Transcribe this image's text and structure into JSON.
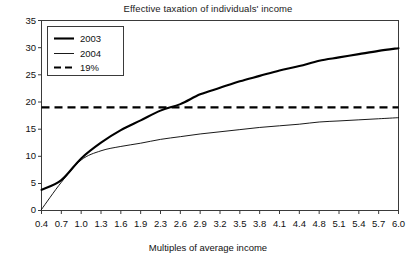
{
  "chart_data": {
    "type": "line",
    "title": "Effective taxation of individuals' income",
    "xlabel": "Multiples of average income",
    "ylabel": "",
    "xlim": [
      0.4,
      6.0
    ],
    "ylim": [
      0,
      35
    ],
    "grid": false,
    "legend_position": "top-left",
    "xtick_labels": [
      "0.4",
      "0.7",
      "1.0",
      "1.3",
      "1.6",
      "1.9",
      "2.3",
      "2.6",
      "2.9",
      "3.2",
      "3.5",
      "3.8",
      "4.1",
      "4.4",
      "4.8",
      "5.1",
      "5.4",
      "5.7",
      "6.0"
    ],
    "ytick_labels": [
      "0",
      "5",
      "10",
      "15",
      "20",
      "25",
      "30",
      "35"
    ],
    "ytick_values": [
      0,
      5,
      10,
      15,
      20,
      25,
      30,
      35
    ],
    "x": [
      0.4,
      0.7,
      1.0,
      1.3,
      1.6,
      1.9,
      2.3,
      2.6,
      2.9,
      3.2,
      3.5,
      3.8,
      4.1,
      4.4,
      4.8,
      5.1,
      5.4,
      5.7,
      6.0
    ],
    "series": [
      {
        "name": "2003",
        "style": "solid-thick",
        "color": "#000000",
        "values": [
          3.8,
          5.6,
          9.6,
          12.5,
          14.8,
          16.6,
          18.4,
          19.6,
          21.4,
          22.6,
          23.8,
          24.8,
          25.8,
          26.6,
          27.6,
          28.2,
          28.8,
          29.4,
          29.9
        ]
      },
      {
        "name": "2004",
        "style": "solid-thin",
        "color": "#000000",
        "values": [
          0.2,
          5.2,
          9.3,
          11.0,
          11.8,
          12.4,
          13.1,
          13.6,
          14.1,
          14.5,
          14.9,
          15.3,
          15.6,
          15.9,
          16.3,
          16.5,
          16.7,
          16.9,
          17.1
        ]
      },
      {
        "name": "19%",
        "style": "dashed",
        "color": "#000000",
        "constant": 19,
        "values": [
          19,
          19,
          19,
          19,
          19,
          19,
          19,
          19,
          19,
          19,
          19,
          19,
          19,
          19,
          19,
          19,
          19,
          19,
          19
        ]
      }
    ],
    "annotations": [
      "2003 curve crosses the 19% reference line near 2.6 multiples of average income"
    ]
  },
  "legend": {
    "items": [
      {
        "label": "2003"
      },
      {
        "label": "2004"
      },
      {
        "label": "19%"
      }
    ]
  }
}
